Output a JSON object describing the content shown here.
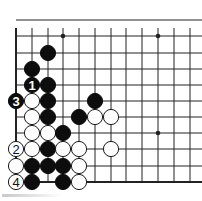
{
  "diagram": {
    "type": "go-board-fragment",
    "columns_visible": 12,
    "rows_visible": 11,
    "edges": {
      "left": true,
      "bottom": true,
      "top": false,
      "right": false
    },
    "grid": {
      "x": [
        16,
        32,
        48,
        63,
        79,
        95,
        111,
        126,
        142,
        158,
        174,
        190
      ],
      "y": [
        20,
        36,
        53,
        69,
        85,
        101,
        117,
        133,
        149,
        166,
        182
      ]
    },
    "star_points": [
      {
        "col": 3,
        "row": 1
      },
      {
        "col": 9,
        "row": 1
      },
      {
        "col": 9,
        "row": 7
      }
    ],
    "colors": {
      "line": "#222222",
      "black_stone": "#0d0d0d",
      "white_stone": "#ffffff",
      "background": "#ffffff"
    },
    "stones": [
      {
        "col": 2,
        "row": 2,
        "color": "black",
        "label": ""
      },
      {
        "col": 1,
        "row": 3,
        "color": "black",
        "label": ""
      },
      {
        "col": 1,
        "row": 4,
        "color": "black",
        "label": "1"
      },
      {
        "col": 2,
        "row": 4,
        "color": "black",
        "label": ""
      },
      {
        "col": 0,
        "row": 5,
        "color": "black",
        "label": "3"
      },
      {
        "col": 1,
        "row": 5,
        "color": "white",
        "label": ""
      },
      {
        "col": 2,
        "row": 5,
        "color": "black",
        "label": ""
      },
      {
        "col": 5,
        "row": 5,
        "color": "black",
        "label": ""
      },
      {
        "col": 1,
        "row": 6,
        "color": "white",
        "label": ""
      },
      {
        "col": 2,
        "row": 6,
        "color": "black",
        "label": ""
      },
      {
        "col": 4,
        "row": 6,
        "color": "black",
        "label": ""
      },
      {
        "col": 5,
        "row": 6,
        "color": "white",
        "label": ""
      },
      {
        "col": 6,
        "row": 6,
        "color": "white",
        "label": ""
      },
      {
        "col": 1,
        "row": 7,
        "color": "white",
        "label": ""
      },
      {
        "col": 2,
        "row": 7,
        "color": "white",
        "label": ""
      },
      {
        "col": 3,
        "row": 7,
        "color": "black",
        "label": ""
      },
      {
        "col": 0,
        "row": 8,
        "color": "white",
        "label": "2"
      },
      {
        "col": 1,
        "row": 8,
        "color": "white",
        "label": ""
      },
      {
        "col": 2,
        "row": 8,
        "color": "black",
        "label": ""
      },
      {
        "col": 3,
        "row": 8,
        "color": "white",
        "label": ""
      },
      {
        "col": 4,
        "row": 8,
        "color": "white",
        "label": ""
      },
      {
        "col": 6,
        "row": 8,
        "color": "white",
        "label": ""
      },
      {
        "col": 0,
        "row": 9,
        "color": "white",
        "label": ""
      },
      {
        "col": 1,
        "row": 9,
        "color": "black",
        "label": ""
      },
      {
        "col": 2,
        "row": 9,
        "color": "black",
        "label": ""
      },
      {
        "col": 3,
        "row": 9,
        "color": "black",
        "label": ""
      },
      {
        "col": 4,
        "row": 9,
        "color": "white",
        "label": ""
      },
      {
        "col": 0,
        "row": 10,
        "color": "white",
        "label": "4"
      },
      {
        "col": 1,
        "row": 10,
        "color": "black",
        "label": ""
      },
      {
        "col": 3,
        "row": 10,
        "color": "black",
        "label": ""
      },
      {
        "col": 4,
        "row": 10,
        "color": "white",
        "label": ""
      }
    ]
  }
}
